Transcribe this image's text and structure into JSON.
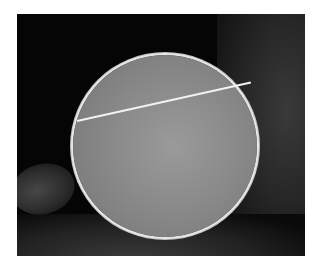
{
  "image": {
    "description": "Grayscale micrograph of a circular cross-section with a bright rim and a straight bright line crossing its upper part, against a dark textured background",
    "colors": {
      "background_border": "#ffffff",
      "photo_background": "#050505",
      "disc_fill": "#8a8a8a",
      "rim": "#e6e6e6",
      "line": "#f2f2f2"
    }
  }
}
